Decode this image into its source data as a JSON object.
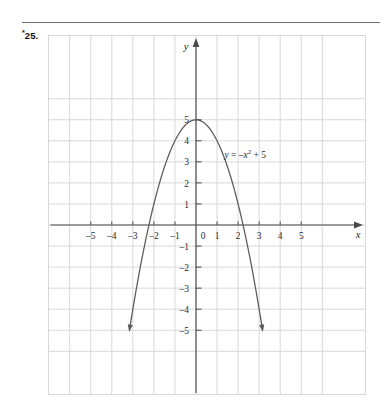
{
  "exercise": {
    "marker": "*",
    "number": "25."
  },
  "chart_data": {
    "type": "line",
    "title": "",
    "subtitle": "",
    "equation_label": "y = –x² + 5",
    "equation_parts": {
      "lhs": "y",
      "equals": " = ",
      "rhs_sign": "–",
      "rhs_var": "x",
      "rhs_exp": "2",
      "rhs_rest": " + 5"
    },
    "function": "y = -x^2 + 5",
    "xlabel": "x",
    "ylabel": "y",
    "xlim": [
      -5.8,
      5.8
    ],
    "ylim": [
      -5.6,
      5.9
    ],
    "xticks": [
      -5,
      -4,
      -3,
      -2,
      -1,
      0,
      1,
      2,
      3,
      4,
      5
    ],
    "yticks": [
      -5,
      -4,
      -3,
      -2,
      -1,
      1,
      2,
      3,
      4,
      5
    ],
    "xtick_labels": [
      "–5",
      "–4",
      "–3",
      "–2",
      "–1",
      "0",
      "1",
      "2",
      "3",
      "4",
      "5"
    ],
    "ytick_labels": [
      "–5",
      "–4",
      "–3",
      "–2",
      "–1",
      "1",
      "2",
      "3",
      "4",
      "5"
    ],
    "origin_label": "0",
    "grid": true,
    "grid_color": "#d8d8dc",
    "axis_color": "#4a4a4a",
    "curve_color": "#5a5a5a",
    "vertex": [
      0,
      5
    ],
    "x_intercepts": [
      -2.236,
      2.236
    ],
    "y_intercept": 5,
    "curve_x_range": [
      -3.12,
      3.12
    ],
    "curve_y_min": -4.73,
    "arrowheads": [
      "curve-left-end",
      "curve-right-end",
      "x-axis-right",
      "y-axis-top"
    ],
    "legend": "none",
    "points": [
      {
        "x": -3.12,
        "y": -4.73
      },
      {
        "x": -3.0,
        "y": -4.0
      },
      {
        "x": -2.5,
        "y": -1.25
      },
      {
        "x": -2.236,
        "y": 0
      },
      {
        "x": -2.0,
        "y": 1.0
      },
      {
        "x": -1.5,
        "y": 2.75
      },
      {
        "x": -1.0,
        "y": 4.0
      },
      {
        "x": -0.5,
        "y": 4.75
      },
      {
        "x": 0,
        "y": 5
      },
      {
        "x": 0.5,
        "y": 4.75
      },
      {
        "x": 1.0,
        "y": 4.0
      },
      {
        "x": 1.5,
        "y": 2.75
      },
      {
        "x": 2.0,
        "y": 1.0
      },
      {
        "x": 2.236,
        "y": 0
      },
      {
        "x": 2.5,
        "y": -1.25
      },
      {
        "x": 3.0,
        "y": -4.0
      },
      {
        "x": 3.12,
        "y": -4.73
      }
    ]
  }
}
